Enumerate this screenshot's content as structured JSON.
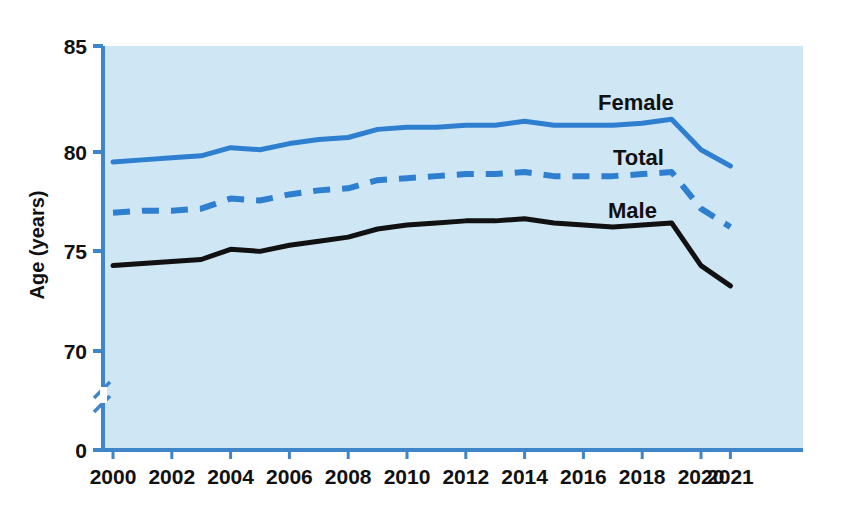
{
  "chart_data": {
    "type": "line",
    "title": "",
    "xlabel": "",
    "ylabel": "Age (years)",
    "ylim": [
      68.5,
      85
    ],
    "yticks": [
      0,
      70,
      75,
      80,
      85
    ],
    "ytick_labels": [
      "0",
      "70",
      "75",
      "80",
      "85"
    ],
    "axis_break": true,
    "xlim": [
      2000,
      2021
    ],
    "xticks": [
      2000,
      2002,
      2004,
      2006,
      2008,
      2010,
      2012,
      2014,
      2016,
      2018,
      2020,
      2021
    ],
    "xtick_labels": [
      "2000",
      "2002",
      "2004",
      "2006",
      "2008",
      "2010",
      "2012",
      "2014",
      "2016",
      "2018",
      "2020",
      "2021"
    ],
    "x": [
      2000,
      2001,
      2002,
      2003,
      2004,
      2005,
      2006,
      2007,
      2008,
      2009,
      2010,
      2011,
      2012,
      2013,
      2014,
      2015,
      2016,
      2017,
      2018,
      2019,
      2020,
      2021
    ],
    "grid": false,
    "legend_position": "inline-right",
    "series": [
      {
        "name": "Female",
        "color": "#2f7fd1",
        "style": "solid",
        "values": [
          79.3,
          79.4,
          79.5,
          79.6,
          80.0,
          79.9,
          80.2,
          80.4,
          80.5,
          80.9,
          81.0,
          81.0,
          81.1,
          81.1,
          81.3,
          81.1,
          81.1,
          81.1,
          81.2,
          81.4,
          79.9,
          79.1
        ]
      },
      {
        "name": "Total",
        "color": "#2f7fd1",
        "style": "dashed",
        "values": [
          76.8,
          76.9,
          76.9,
          77.0,
          77.5,
          77.4,
          77.7,
          77.9,
          78.0,
          78.4,
          78.5,
          78.6,
          78.7,
          78.7,
          78.8,
          78.6,
          78.6,
          78.6,
          78.7,
          78.8,
          77.0,
          76.1
        ]
      },
      {
        "name": "Male",
        "color": "#111111",
        "style": "solid",
        "values": [
          74.2,
          74.3,
          74.4,
          74.5,
          75.0,
          74.9,
          75.2,
          75.4,
          75.6,
          76.0,
          76.2,
          76.3,
          76.4,
          76.4,
          76.5,
          76.3,
          76.2,
          76.1,
          76.2,
          76.3,
          74.2,
          73.2
        ]
      }
    ]
  },
  "plot": {
    "background_color": "#cfe6f5",
    "axis_color": "#3f86c8",
    "left_px": 103,
    "right_px": 803,
    "top_px": 46,
    "bottom_px": 450,
    "y85_px": 46,
    "y80_px": 152,
    "y75_px": 251,
    "y70_px": 351,
    "y0_px": 450,
    "break_y_px": 390,
    "x2000_px": 113,
    "x_step_px": 29.4
  },
  "labels": {
    "series_female": "Female",
    "series_total": "Total",
    "series_male": "Male",
    "y_axis_title": "Age (years)"
  }
}
